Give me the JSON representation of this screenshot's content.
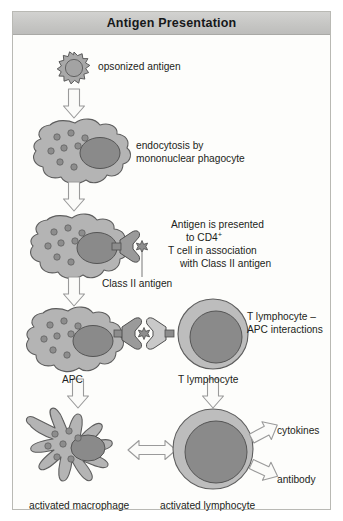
{
  "figure": {
    "title": "Antigen Presentation",
    "background_color": "#fdfdfb",
    "border_color": "#b9b9b4",
    "header_color": "#c6c6c4"
  },
  "palette": {
    "cytoplasm": "#b0b0b0",
    "cytoplasm_light": "#bdbdbd",
    "nucleus": "#8a8a8a",
    "granule": "#8f8f8f",
    "antigen": "#a8a8a8",
    "receptor_dark": "#9a9a9a",
    "receptor_light": "#c9c9c9",
    "outline": "#6b6b6b",
    "arrow_fill": "#fbfbf9",
    "arrow_stroke": "#9a9a9a",
    "text": "#1c1e20"
  },
  "steps": [
    {
      "id": "step-1",
      "name": "opsonized-antigen",
      "label": "opsonized antigen",
      "shape": "spiky-antigen"
    },
    {
      "id": "step-2",
      "name": "endocytosis",
      "label_line1": "endocytosis by",
      "label_line2": "mononuclear phagocyte",
      "shape": "phagocyte"
    },
    {
      "id": "step-3",
      "name": "antigen-presentation",
      "label_line1": "Antigen is presented",
      "label_line2": "to CD4",
      "label_line2_sup": "+",
      "label_line3": "T cell in association",
      "label_line4": "with Class II antigen",
      "callout": "Class II antigen",
      "shape": "phagocyte-with-mhc"
    },
    {
      "id": "step-4",
      "name": "t-lymphocyte-apc-interaction",
      "label_line1": "T lymphocyte –",
      "label_line2": "APC interactions",
      "left_label": "APC",
      "right_label": "T lymphocyte",
      "shape": "apc-plus-t-cell"
    },
    {
      "id": "step-5",
      "name": "activation-outputs",
      "left_label": "activated macrophage",
      "right_label": "activated lymphocyte",
      "output_1": "cytokines",
      "output_2": "antibody",
      "shape": "activated-macrophage-and-lymphocyte"
    }
  ],
  "arrows": [
    {
      "name": "arrow-antigen-to-phagocyte",
      "direction": "down"
    },
    {
      "name": "arrow-phagocyte-to-presentation",
      "direction": "down"
    },
    {
      "name": "arrow-presentation-to-interaction",
      "direction": "down"
    },
    {
      "name": "arrow-apc-to-activated-macrophage",
      "direction": "down"
    },
    {
      "name": "arrow-tcell-to-activated-lymphocyte",
      "direction": "down"
    },
    {
      "name": "arrow-macrophage-lymphocyte-crosstalk",
      "direction": "double-horizontal"
    },
    {
      "name": "arrow-cytokines",
      "direction": "up-right"
    },
    {
      "name": "arrow-antibody",
      "direction": "down-right"
    }
  ]
}
